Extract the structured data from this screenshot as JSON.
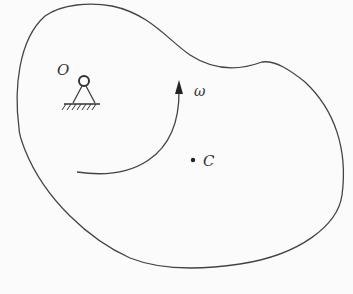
{
  "diagram": {
    "type": "rigid-body-rotation",
    "labels": {
      "pivot": "O",
      "angular_velocity": "ω",
      "center_of_mass": "C"
    },
    "colors": {
      "stroke": "#444444",
      "background": "#fbfbfb"
    }
  }
}
